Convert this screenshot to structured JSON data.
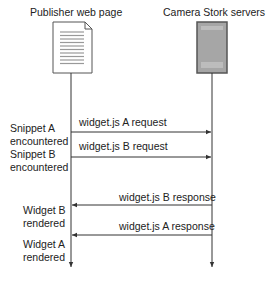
{
  "participants": [
    {
      "id": "publisher",
      "label": "Publisher web page",
      "icon": "document-icon"
    },
    {
      "id": "server",
      "label": "Camera Stork servers",
      "icon": "server-icon"
    }
  ],
  "messages": [
    {
      "label": "widget.js A request",
      "from": "publisher",
      "to": "server"
    },
    {
      "label": "widget.js B request",
      "from": "publisher",
      "to": "server"
    },
    {
      "label": "widget.js B response",
      "from": "server",
      "to": "publisher"
    },
    {
      "label": "widget.js A response",
      "from": "server",
      "to": "publisher"
    }
  ],
  "events": [
    {
      "line1": "Snippet A",
      "line2": "encountered"
    },
    {
      "line1": "Snippet B",
      "line2": "encountered"
    },
    {
      "line1": "Widget B",
      "line2": "rendered"
    },
    {
      "line1": "Widget A",
      "line2": "rendered"
    }
  ],
  "colors": {
    "line": "#333333",
    "server_fill": "#a6a6a6",
    "server_border": "#555555",
    "doc_lines": "#999999"
  }
}
